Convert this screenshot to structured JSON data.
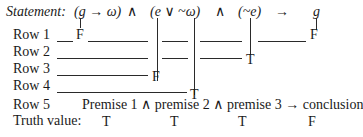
{
  "statement": {
    "label": "Statement:",
    "parts": {
      "p1": "(g → ω)",
      "and1": "∧",
      "p2": "(e ∨ ~ω)",
      "and2": "∧",
      "p3": "(~e)",
      "arrow": "→",
      "conclusion": "g"
    }
  },
  "rows": [
    {
      "label": "Row 1",
      "values": [
        "F",
        "F"
      ]
    },
    {
      "label": "Row 2",
      "values": [
        "T"
      ]
    },
    {
      "label": "Row 3",
      "values": [
        "F"
      ]
    },
    {
      "label": "Row 4",
      "values": [
        "T"
      ]
    },
    {
      "label": "Row 5",
      "text": "Premise 1 ∧ premise 2 ∧ premise 3 → conclusion"
    }
  ],
  "truth": {
    "label": "Truth value:",
    "values": [
      "T",
      "T",
      "T",
      "F"
    ]
  }
}
